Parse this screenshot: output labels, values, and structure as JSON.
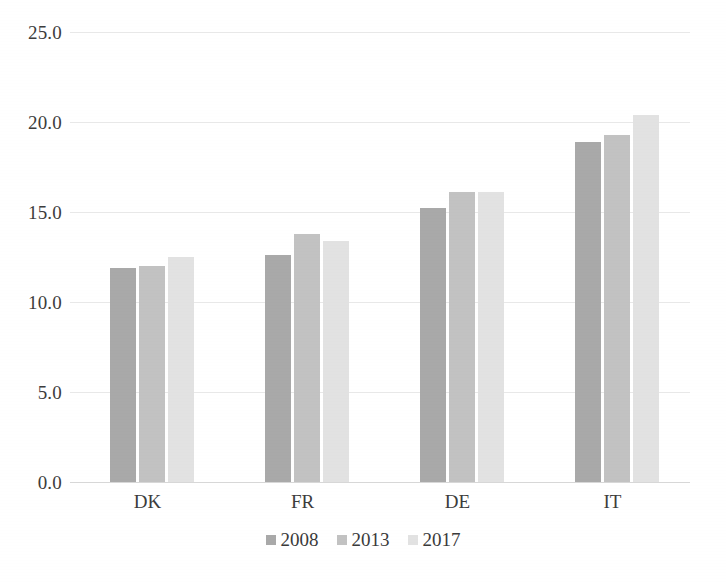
{
  "chart_data": {
    "type": "bar",
    "title": "",
    "subtitle": "",
    "xlabel": "",
    "ylabel": "",
    "categories": [
      "DK",
      "FR",
      "DE",
      "IT"
    ],
    "series": [
      {
        "name": "2008",
        "color": "#a9a9a9",
        "values": [
          11.9,
          12.6,
          15.2,
          18.9
        ]
      },
      {
        "name": "2013",
        "color": "#c2c2c2",
        "values": [
          12.0,
          13.8,
          16.1,
          19.3
        ]
      },
      {
        "name": "2017",
        "color": "#e2e2e2",
        "values": [
          12.5,
          13.4,
          16.1,
          20.4
        ]
      }
    ],
    "ylim": [
      0.0,
      25.0
    ],
    "ytick_labels": [
      "0.0",
      "5.0",
      "10.0",
      "15.0",
      "20.0",
      "25.0"
    ],
    "ytick_values": [
      0.0,
      5.0,
      10.0,
      15.0,
      20.0,
      25.0
    ],
    "grid": true,
    "grid_axis": "y",
    "legend_position": "bottom",
    "legend_entries": [
      "2008",
      "2013",
      "2017"
    ],
    "background_color": "#ffffff",
    "gridline_color": "#e9e9e9",
    "axis_color": "#d8d8d8",
    "text_color": "#3a3a3a"
  }
}
